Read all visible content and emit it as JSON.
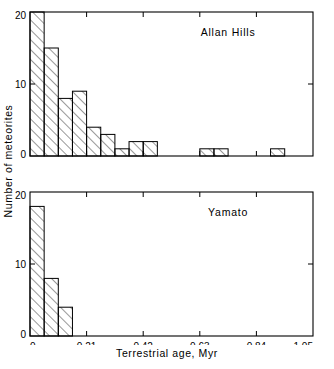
{
  "chart_data": [
    {
      "type": "bar",
      "title": "Allan Hills",
      "xlabel": "Terrestrial age, Myr",
      "ylabel": "Number of meteorites",
      "xlim": [
        0,
        1.05
      ],
      "ylim": [
        0,
        20
      ],
      "bin_width": 0.0525,
      "xticks": [
        0,
        0.21,
        0.42,
        0.63,
        0.84,
        1.05
      ],
      "xticklabels": [
        "0",
        "0.21",
        "0.42",
        "0.63",
        "0.84",
        "1.05"
      ],
      "yticks": [
        0,
        10,
        20
      ],
      "yticklabels": [
        "0",
        "10",
        "20"
      ],
      "grid": false,
      "legend": "none",
      "bin_starts": [
        0,
        0.0525,
        0.105,
        0.1575,
        0.21,
        0.2625,
        0.315,
        0.3675,
        0.42,
        0.4725,
        0.525,
        0.5775,
        0.63,
        0.6825,
        0.735,
        0.7875,
        0.84,
        0.8925,
        0.945,
        0.9975
      ],
      "values": [
        20,
        15,
        8,
        9,
        4,
        3,
        1,
        2,
        2,
        0,
        0,
        0,
        1,
        1,
        0,
        0,
        0,
        1,
        0,
        0
      ]
    },
    {
      "type": "bar",
      "title": "Yamato",
      "xlabel": "Terrestrial age, Myr",
      "ylabel": "Number of meteorites",
      "xlim": [
        0,
        1.05
      ],
      "ylim": [
        0,
        20
      ],
      "bin_width": 0.0525,
      "xticks": [
        0,
        0.21,
        0.42,
        0.63,
        0.84,
        1.05
      ],
      "xticklabels": [
        "0",
        "0.21",
        "0.42",
        "0.63",
        "0.84",
        "1.05"
      ],
      "yticks": [
        0,
        10,
        20
      ],
      "yticklabels": [
        "0",
        "10",
        "20"
      ],
      "grid": false,
      "legend": "none",
      "bin_starts": [
        0,
        0.0525,
        0.105
      ],
      "values": [
        18,
        8,
        4
      ]
    }
  ],
  "figure": {
    "ylabel": "Number of meteorites",
    "xlabel": "Terrestrial age, Myr",
    "panels": [
      {
        "name": "allan-hills",
        "title": "Allan Hills",
        "ytick_labels": [
          "0",
          "10",
          "20"
        ],
        "xtick_labels": [
          "0",
          "0.21",
          "0.42",
          "0.63",
          "0.84",
          "1.05"
        ]
      },
      {
        "name": "yamato",
        "title": "Yamato",
        "ytick_labels": [
          "0",
          "10",
          "20"
        ],
        "xtick_labels": [
          "0",
          "0.21",
          "0.42",
          "0.63",
          "0.84",
          "1.05"
        ]
      }
    ],
    "colors": {
      "axis": "#000000",
      "bar_edge": "#000000",
      "bar_fill": "#ffffff",
      "hatch": "#000000",
      "background": "#ffffff"
    }
  }
}
